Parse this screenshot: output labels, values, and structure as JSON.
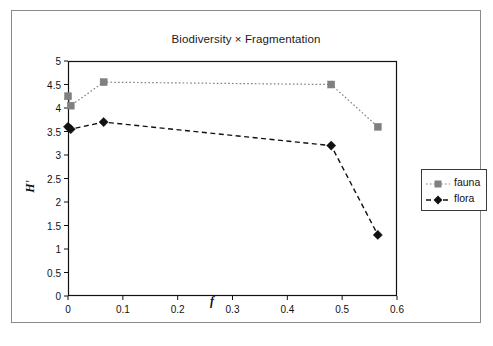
{
  "chart_data": {
    "type": "line",
    "title": "Biodiversity × Fragmentation",
    "xlabel": "f",
    "ylabel": "H'",
    "xlim": [
      0,
      0.6
    ],
    "ylim": [
      0,
      5
    ],
    "xticks": [
      "0",
      "0.1",
      "0.2",
      "0.3",
      "0.4",
      "0.5",
      "0.6"
    ],
    "xtick_values": [
      0,
      0.1,
      0.2,
      0.3,
      0.4,
      0.5,
      0.6
    ],
    "yticks": [
      "0",
      "0.5",
      "1",
      "1.5",
      "2",
      "2.5",
      "3",
      "3.5",
      "4",
      "4.5",
      "5"
    ],
    "ytick_values": [
      0,
      0.5,
      1,
      1.5,
      2,
      2.5,
      3,
      3.5,
      4,
      4.5,
      5
    ],
    "grid": false,
    "legend_position": "right",
    "series": [
      {
        "name": "fauna",
        "color": "#808080",
        "marker": "square",
        "linestyle": "dotted",
        "x": [
          0,
          0.005,
          0.065,
          0.48,
          0.565
        ],
        "y": [
          4.25,
          4.05,
          4.55,
          4.5,
          3.6
        ]
      },
      {
        "name": "flora",
        "color": "#111111",
        "marker": "diamond",
        "linestyle": "dashed",
        "x": [
          0,
          0.005,
          0.065,
          0.48,
          0.565
        ],
        "y": [
          3.6,
          3.55,
          3.7,
          3.2,
          1.3
        ]
      }
    ]
  },
  "legend": {
    "entries": [
      {
        "label": "fauna"
      },
      {
        "label": "flora"
      }
    ]
  },
  "colors": {
    "fauna": "#808080",
    "flora": "#111111",
    "axis": "#111111",
    "frame": "#8a8a8a",
    "background": "#ffffff"
  }
}
